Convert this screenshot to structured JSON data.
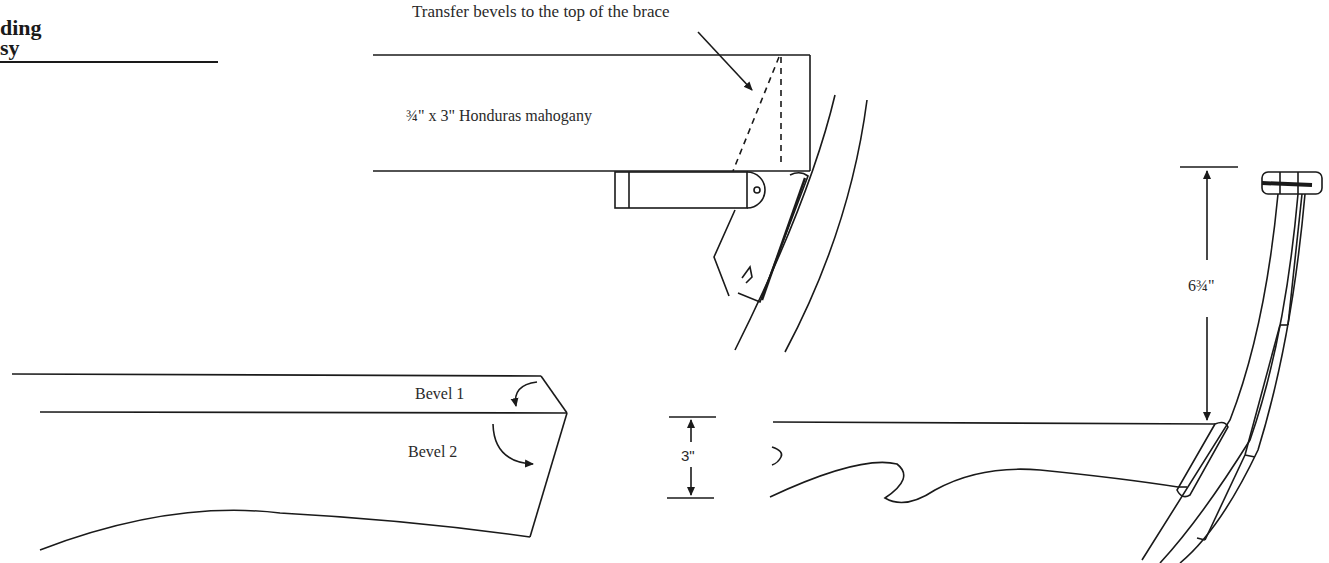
{
  "title": {
    "line1": "ding",
    "line2": "sy"
  },
  "figure_top": {
    "callout": "Transfer bevels to the top of the brace",
    "stock_label": "¾\" x 3\" Honduras mahogany"
  },
  "figure_bottom_left": {
    "bevel1_label": "Bevel 1",
    "bevel2_label": "Bevel 2"
  },
  "figure_bottom_right": {
    "height_dimension": "3\"",
    "rise_dimension": "6¾\""
  },
  "colors": {
    "ink": "#1a1a1a",
    "paper": "#ffffff"
  }
}
